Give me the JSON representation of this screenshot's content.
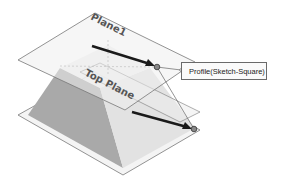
{
  "diagram": {
    "planes": [
      {
        "id": "plane1",
        "label": "Plane1"
      },
      {
        "id": "top-plane",
        "label": "Top Plane"
      }
    ],
    "callout": {
      "label": "Profile(Sketch-Square)"
    },
    "colors": {
      "plane_edge": "#777777",
      "plane_fill": "#f0f0f0",
      "shape_dark_face": "#a8a8a8",
      "shape_light_face": "#dcdcdc",
      "arrow": "#1a1a1a",
      "callout_border": "#6a6a6a"
    }
  }
}
